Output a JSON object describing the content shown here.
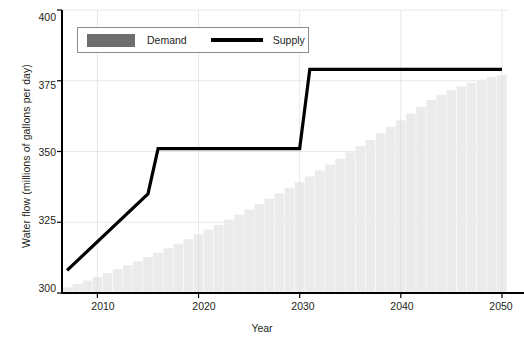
{
  "chart_data": {
    "type": "bar",
    "title": "",
    "xlabel": "Year",
    "ylabel": "Water flow (millions of gallons per day)",
    "xlim": [
      2006.5,
      2050.5
    ],
    "ylim": [
      300,
      400
    ],
    "xticks": [
      2010,
      2020,
      2030,
      2040,
      2050
    ],
    "yticks": [
      300,
      325,
      350,
      375,
      400
    ],
    "grid": true,
    "legend_position": "top-left-inside",
    "series": [
      {
        "name": "Demand",
        "type": "bar",
        "color": "#ebebeb",
        "legend_swatch_color": "#6e6e6e",
        "x": [
          2007,
          2008,
          2009,
          2010,
          2011,
          2012,
          2013,
          2014,
          2015,
          2016,
          2017,
          2018,
          2019,
          2020,
          2021,
          2022,
          2023,
          2024,
          2025,
          2026,
          2027,
          2028,
          2029,
          2030,
          2031,
          2032,
          2033,
          2034,
          2035,
          2036,
          2037,
          2038,
          2039,
          2040,
          2041,
          2042,
          2043,
          2044,
          2045,
          2046,
          2047,
          2048,
          2049,
          2050
        ],
        "values": [
          302.0,
          303.2,
          304.4,
          305.7,
          307.0,
          308.4,
          309.8,
          311.2,
          312.7,
          314.2,
          315.8,
          317.4,
          319.0,
          320.7,
          322.4,
          324.1,
          325.9,
          327.7,
          329.5,
          331.4,
          333.3,
          335.2,
          337.2,
          339.2,
          341.2,
          343.3,
          345.4,
          347.5,
          349.7,
          351.9,
          354.1,
          356.4,
          358.7,
          361.0,
          363.4,
          365.8,
          368.2,
          370.0,
          371.6,
          373.0,
          374.3,
          375.4,
          376.3,
          377.0
        ]
      },
      {
        "name": "Supply",
        "type": "line",
        "color": "#000000",
        "x": [
          2007,
          2015,
          2016,
          2030,
          2031,
          2050
        ],
        "values": [
          308.0,
          335.0,
          351.0,
          351.0,
          379.0,
          379.0
        ]
      }
    ]
  },
  "legend": {
    "demand_label": "Demand",
    "supply_label": "Supply"
  },
  "axes": {
    "y_title": "Water flow (millions of gallons per day)",
    "x_title": "Year"
  }
}
